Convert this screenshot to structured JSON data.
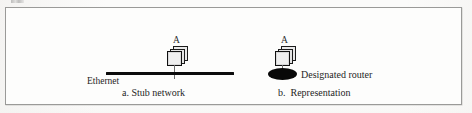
{
  "figure": {
    "background_color": "#fbfbfa",
    "frame_border_color": "#9a9a98",
    "ink_color": "#0c0c0c",
    "panels": [
      {
        "id": "stub-network",
        "node_label": "A",
        "medium_label": "Ethernet",
        "caption": "a. Stub network"
      },
      {
        "id": "representation",
        "node_label": "A",
        "medium_label": "Designated router",
        "caption": "b.  Representation"
      }
    ]
  },
  "left_panel": {
    "node_letter": "A",
    "ethernet_label": "Ethernet",
    "caption": "a. Stub network"
  },
  "right_panel": {
    "node_letter": "A",
    "designated_router_label": "Designated router",
    "caption": "b.  Representation"
  }
}
